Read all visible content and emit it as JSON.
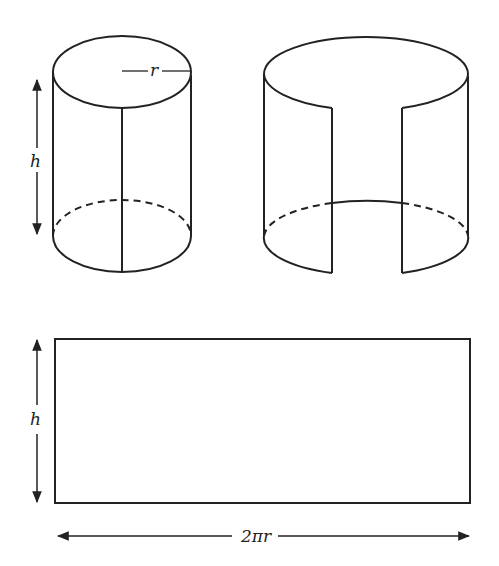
{
  "figure": {
    "stroke_color": "#222222",
    "background": "#ffffff"
  },
  "labels": {
    "radius": "r",
    "height_cylinder": "h",
    "height_rectangle": "h",
    "width_rectangle": "2πr"
  },
  "parts": [
    {
      "id": "closed-cylinder",
      "label": "Cylinder with radius r and height h"
    },
    {
      "id": "cut-cylinder",
      "label": "Cylinder cut along seam and opened"
    },
    {
      "id": "unrolled-rectangle",
      "label": "Lateral surface unrolled into rectangle h × 2πr"
    }
  ]
}
